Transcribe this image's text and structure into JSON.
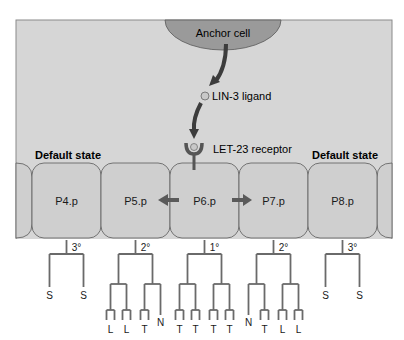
{
  "colors": {
    "panel": "#d6d6d6",
    "panel_border": "#8a8a8a",
    "cell_fill": "#cfcfcf",
    "cell_stroke": "#5a5a5a",
    "anchor_fill": "#9a9a9a",
    "arrow": "#3a3a3a",
    "tree": "#6a6a6a",
    "text": "#1a1a1a",
    "ligand_fill": "#c8c8c8"
  },
  "anchor_cell": {
    "label": "Anchor cell"
  },
  "ligand": {
    "label": "LIN-3 ligand"
  },
  "receptor": {
    "label": "LET-23 receptor"
  },
  "default_state_left": {
    "label": "Default state"
  },
  "default_state_right": {
    "label": "Default state"
  },
  "cells": [
    {
      "id": "p4",
      "label": "P4.p",
      "fate": "3°",
      "tree": "tertiary",
      "leaves": [
        "S",
        "S"
      ]
    },
    {
      "id": "p5",
      "label": "P5.p",
      "fate": "2°",
      "tree": "secondary-left",
      "leaves": [
        "L",
        "L",
        "T",
        "N"
      ]
    },
    {
      "id": "p6",
      "label": "P6.p",
      "fate": "1°",
      "tree": "primary",
      "leaves": [
        "T",
        "T",
        "T",
        "T"
      ]
    },
    {
      "id": "p7",
      "label": "P7.p",
      "fate": "2°",
      "tree": "secondary-right",
      "leaves": [
        "N",
        "T",
        "L",
        "L"
      ]
    },
    {
      "id": "p8",
      "label": "P8.p",
      "fate": "3°",
      "tree": "tertiary",
      "leaves": [
        "S",
        "S"
      ]
    }
  ]
}
